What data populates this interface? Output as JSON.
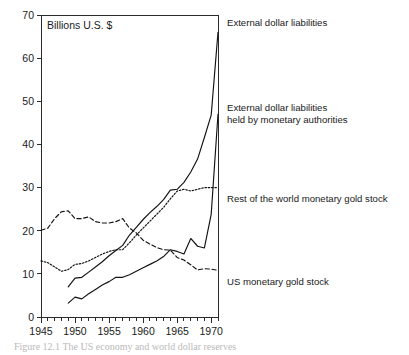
{
  "figure": {
    "unit_label": "Billions U.S. $",
    "caption": "Figure 12.1 The US economy and world dollar reserves"
  },
  "chart_data": {
    "type": "line",
    "title": "",
    "xlabel": "",
    "ylabel": "Billions U.S. $",
    "xlim": [
      1945,
      1971
    ],
    "ylim": [
      0,
      70
    ],
    "yticks": [
      0,
      10,
      20,
      30,
      40,
      50,
      60,
      70
    ],
    "xticks": [
      1945,
      1950,
      1955,
      1960,
      1965,
      1970
    ],
    "xtick_labels": [
      "1945",
      "1950",
      "1955",
      "1960",
      "1965",
      "1970"
    ],
    "ytick_labels": [
      "0",
      "10",
      "20",
      "30",
      "40",
      "50",
      "60",
      "70"
    ],
    "minor_xticks_every": 1,
    "grid": false,
    "legend_position": "right-inline-annotations",
    "series": [
      {
        "name": "External dollar liabilities",
        "style": "solid",
        "label_anchor_value": 66,
        "x": [
          1949,
          1950,
          1951,
          1952,
          1953,
          1954,
          1955,
          1956,
          1957,
          1958,
          1959,
          1960,
          1961,
          1962,
          1963,
          1964,
          1965,
          1966,
          1967,
          1968,
          1969,
          1970,
          1971
        ],
        "values": [
          7.0,
          9.0,
          9.2,
          10.4,
          11.6,
          12.8,
          14.2,
          15.4,
          16.6,
          19.0,
          20.8,
          22.6,
          24.2,
          25.6,
          27.2,
          29.4,
          29.6,
          31.2,
          33.6,
          36.6,
          41.6,
          46.8,
          66.0
        ]
      },
      {
        "name": "External dollar liabilities held by monetary authorities",
        "style": "solid",
        "label_anchor_value": 47,
        "x": [
          1949,
          1950,
          1951,
          1952,
          1953,
          1954,
          1955,
          1956,
          1957,
          1958,
          1959,
          1960,
          1961,
          1962,
          1963,
          1964,
          1965,
          1966,
          1967,
          1968,
          1969,
          1970,
          1971
        ],
        "values": [
          3.2,
          4.6,
          4.2,
          5.4,
          6.4,
          7.4,
          8.2,
          9.2,
          9.2,
          9.8,
          10.6,
          11.4,
          12.2,
          13.0,
          14.0,
          15.6,
          15.2,
          14.6,
          18.2,
          16.4,
          16.0,
          23.8,
          47.0
        ]
      },
      {
        "name": "Rest of the world monetary gold stock",
        "style": "dotted",
        "label_anchor_value": 30,
        "x": [
          1945,
          1946,
          1947,
          1948,
          1949,
          1950,
          1951,
          1952,
          1953,
          1954,
          1955,
          1956,
          1957,
          1958,
          1959,
          1960,
          1961,
          1962,
          1963,
          1964,
          1965,
          1966,
          1967,
          1968,
          1969,
          1970,
          1971
        ],
        "values": [
          13.0,
          12.6,
          11.6,
          10.6,
          11.0,
          12.2,
          12.4,
          13.0,
          13.8,
          14.6,
          15.2,
          15.6,
          15.6,
          17.2,
          19.0,
          20.6,
          22.2,
          23.8,
          25.4,
          27.4,
          29.2,
          29.6,
          29.2,
          29.6,
          30.0,
          30.0,
          30.0
        ]
      },
      {
        "name": "US monetary gold stock",
        "style": "dashed",
        "label_anchor_value": 11,
        "x": [
          1945,
          1946,
          1947,
          1948,
          1949,
          1950,
          1951,
          1952,
          1953,
          1954,
          1955,
          1956,
          1957,
          1958,
          1959,
          1960,
          1961,
          1962,
          1963,
          1964,
          1965,
          1966,
          1967,
          1968,
          1969,
          1970,
          1971
        ],
        "values": [
          20.1,
          20.6,
          22.8,
          24.4,
          24.6,
          22.8,
          22.8,
          23.2,
          22.1,
          21.8,
          21.8,
          22.1,
          22.8,
          20.6,
          19.5,
          17.8,
          16.9,
          16.1,
          15.6,
          15.5,
          13.8,
          13.2,
          12.1,
          10.9,
          11.2,
          11.1,
          10.8
        ]
      }
    ],
    "annotations": [
      {
        "id": "ann-external-dollar-liabilities",
        "text": "External dollar liabilities",
        "x": 227,
        "y": 26
      },
      {
        "id": "ann-external-held-line1",
        "text": "External dollar liabilities",
        "x": 227,
        "y": 111
      },
      {
        "id": "ann-external-held-line2",
        "text": "held by monetary authorities",
        "x": 227,
        "y": 123
      },
      {
        "id": "ann-rest-of-world-gold",
        "text": "Rest of the world monetary gold stock",
        "x": 227,
        "y": 202
      },
      {
        "id": "ann-us-gold",
        "text": "US monetary gold stock",
        "x": 227,
        "y": 285
      }
    ]
  }
}
